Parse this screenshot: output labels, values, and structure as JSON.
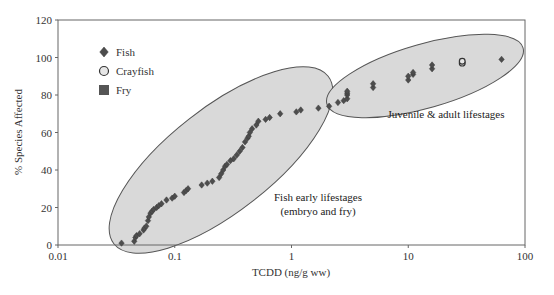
{
  "chart_data": {
    "type": "scatter",
    "title": "",
    "xlabel": "TCDD (ng/g ww)",
    "ylabel": "% Species Affected",
    "xscale": "log",
    "xlim": [
      0.01,
      100
    ],
    "ylim": [
      0,
      120
    ],
    "xticks": [
      "0.01",
      "0.1",
      "1",
      "10",
      "100"
    ],
    "yticks": [
      "0",
      "20",
      "40",
      "60",
      "80",
      "100",
      "120"
    ],
    "grid": false,
    "legend_position": "upper-left",
    "legend": [
      {
        "label": "Fish",
        "marker": "diamond",
        "color": "#555555"
      },
      {
        "label": "Crayfish",
        "marker": "circle",
        "color": "#cccccc"
      },
      {
        "label": "Fry",
        "marker": "square",
        "color": "#555555"
      }
    ],
    "annotations": [
      {
        "text": "Fish early lifestages",
        "x_px": 318,
        "y_px": 201
      },
      {
        "text": "(embryo and fry)",
        "x_px": 318,
        "y_px": 215
      },
      {
        "text": "Juvenile & adult lifestages",
        "x_px": 446,
        "y_px": 118
      }
    ],
    "regions": [
      {
        "label": "Fish early lifestages",
        "cx": 221,
        "cy": 160,
        "rx": 136,
        "ry": 52,
        "rotate": -38
      },
      {
        "label": "Juvenile & adult lifestages",
        "cx": 425,
        "cy": 76,
        "rx": 102,
        "ry": 32,
        "rotate": -16
      }
    ],
    "series": [
      {
        "name": "Fish",
        "marker": "diamond",
        "points": [
          [
            0.035,
            1
          ],
          [
            0.045,
            2
          ],
          [
            0.046,
            4
          ],
          [
            0.047,
            5
          ],
          [
            0.05,
            6
          ],
          [
            0.054,
            8
          ],
          [
            0.055,
            9
          ],
          [
            0.057,
            10
          ],
          [
            0.059,
            13
          ],
          [
            0.06,
            15
          ],
          [
            0.062,
            17
          ],
          [
            0.064,
            18
          ],
          [
            0.066,
            19
          ],
          [
            0.07,
            20
          ],
          [
            0.073,
            21
          ],
          [
            0.077,
            22
          ],
          [
            0.085,
            24
          ],
          [
            0.095,
            25
          ],
          [
            0.1,
            26
          ],
          [
            0.12,
            28
          ],
          [
            0.125,
            29
          ],
          [
            0.13,
            30
          ],
          [
            0.17,
            32
          ],
          [
            0.19,
            33
          ],
          [
            0.21,
            34
          ],
          [
            0.24,
            36
          ],
          [
            0.25,
            38
          ],
          [
            0.26,
            40
          ],
          [
            0.27,
            42
          ],
          [
            0.28,
            43
          ],
          [
            0.3,
            45
          ],
          [
            0.32,
            46
          ],
          [
            0.34,
            48
          ],
          [
            0.36,
            50
          ],
          [
            0.38,
            52
          ],
          [
            0.4,
            55
          ],
          [
            0.42,
            57
          ],
          [
            0.43,
            58
          ],
          [
            0.44,
            60
          ],
          [
            0.46,
            62
          ],
          [
            0.5,
            64
          ],
          [
            0.52,
            66
          ],
          [
            0.6,
            67
          ],
          [
            0.65,
            68
          ],
          [
            0.8,
            70
          ],
          [
            1.1,
            71
          ],
          [
            1.2,
            72
          ],
          [
            1.7,
            73
          ],
          [
            2.1,
            74
          ],
          [
            2.5,
            76
          ],
          [
            2.8,
            77
          ],
          [
            3.0,
            78
          ],
          [
            3.0,
            80
          ],
          [
            3.0,
            81
          ],
          [
            3.0,
            82
          ],
          [
            5.0,
            84
          ],
          [
            5.0,
            86
          ],
          [
            10,
            88
          ],
          [
            10,
            90
          ],
          [
            11,
            91
          ],
          [
            11,
            92
          ],
          [
            16,
            94
          ],
          [
            16,
            96
          ],
          [
            63,
            99
          ]
        ]
      },
      {
        "name": "Crayfish",
        "marker": "circle",
        "points": [
          [
            29,
            97
          ],
          [
            29,
            98
          ]
        ]
      },
      {
        "name": "Fry",
        "marker": "square",
        "points": []
      }
    ]
  }
}
